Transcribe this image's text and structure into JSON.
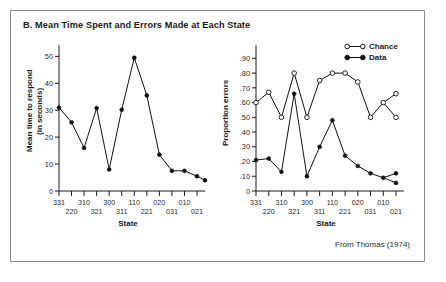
{
  "figure": {
    "title": "B. Mean Time Spent and Errors Made at Each State",
    "attribution": "From Thomas (1974)"
  },
  "chart_data": [
    {
      "type": "line",
      "panel": "left",
      "title": "",
      "xlabel": "State",
      "ylabel": "Mean time to respond\n(in seconds)",
      "categories": [
        "331",
        "220",
        "310",
        "321",
        "300",
        "311",
        "110",
        "221",
        "020",
        "031",
        "010",
        "021"
      ],
      "yticklabels": [
        "0",
        "10",
        "20",
        "30",
        "40",
        "50"
      ],
      "ytickvalues": [
        0,
        10,
        20,
        30,
        40,
        50
      ],
      "ylim": [
        0,
        52
      ],
      "grid": false,
      "legend": "none",
      "series": [
        {
          "name": "Mean time to respond",
          "marker": "filled-circle",
          "values": [
            31,
            25.5,
            16,
            30.8,
            8,
            30.2,
            49.5,
            35.5,
            13.5,
            7.5,
            7.5,
            5.5
          ]
        }
      ],
      "extra_point": {
        "category": "021",
        "value": 4
      }
    },
    {
      "type": "line",
      "panel": "right",
      "title": "",
      "xlabel": "State",
      "ylabel": "Proportion errors",
      "categories": [
        "331",
        "220",
        "310",
        "321",
        "300",
        "311",
        "110",
        "221",
        "020",
        "031",
        "010",
        "021"
      ],
      "yticklabels": [
        "0",
        ".10",
        ".20",
        ".30",
        ".40",
        ".50",
        ".60",
        ".70",
        ".80",
        ".90"
      ],
      "ytickvalues": [
        0,
        0.1,
        0.2,
        0.3,
        0.4,
        0.5,
        0.6,
        0.7,
        0.8,
        0.9
      ],
      "ylim": [
        0,
        0.95
      ],
      "grid": false,
      "legend": "top-right",
      "series": [
        {
          "name": "Chance",
          "marker": "open-circle",
          "values": [
            0.6,
            0.67,
            0.5,
            0.8,
            0.5,
            0.75,
            0.8,
            0.8,
            0.74,
            0.5,
            0.6,
            0.66
          ],
          "branch_value": 0.5
        },
        {
          "name": "Data",
          "marker": "filled-circle",
          "values": [
            0.21,
            0.22,
            0.13,
            0.66,
            0.1,
            0.3,
            0.48,
            0.24,
            0.17,
            0.12,
            0.09,
            0.12
          ],
          "branch_value": 0.055
        }
      ]
    }
  ],
  "legend": {
    "chance_label": "Chance",
    "data_label": "Data"
  },
  "axis_labels": {
    "state": "State"
  },
  "xcat_rows": {
    "top": [
      "331",
      "310",
      "300",
      "110",
      "020",
      "010",
      "021"
    ],
    "bottom": [
      "220",
      "321",
      "311",
      "221",
      "031"
    ]
  },
  "colors": {
    "ink": "#111111",
    "frame": "#8c8c8c",
    "background": "#ffffff"
  }
}
